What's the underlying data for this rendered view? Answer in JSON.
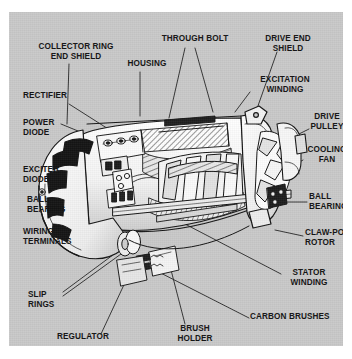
{
  "figure": {
    "kind": "technical-cutaway-illustration",
    "panel_background": "#c9c9c9",
    "page_background": "#ffffff",
    "line_color": "#161616",
    "labels": [
      {
        "id": "collector-ring-end-shield",
        "text": "COLLECTOR RING\nEND SHIELD",
        "x": 13,
        "y": 30,
        "w": 108,
        "align": "c"
      },
      {
        "id": "through-bolt",
        "text": "THROUGH BOLT",
        "x": 146,
        "y": 22,
        "w": 80,
        "align": "c"
      },
      {
        "id": "drive-end-shield",
        "text": "DRIVE END\nSHIELD",
        "x": 248,
        "y": 22,
        "w": 62,
        "align": "c"
      },
      {
        "id": "housing",
        "text": "HOUSING",
        "x": 112,
        "y": 47,
        "w": 52,
        "align": "c"
      },
      {
        "id": "rectifier",
        "text": "RECTIFIER",
        "x": 14,
        "y": 79,
        "w": 54,
        "align": "l"
      },
      {
        "id": "excitation-winding",
        "text": "EXCITATION\nWINDING",
        "x": 243,
        "y": 63,
        "w": 66,
        "align": "c"
      },
      {
        "id": "power-diode",
        "text": "POWER\nDIODE",
        "x": 14,
        "y": 106,
        "w": 46,
        "align": "l"
      },
      {
        "id": "drive-pulley",
        "text": "DRIVE\nPULLEY",
        "x": 297,
        "y": 100,
        "w": 42,
        "align": "c"
      },
      {
        "id": "cooling-fan",
        "text": "COOLING\nFAN",
        "x": 294,
        "y": 133,
        "w": 48,
        "align": "c"
      },
      {
        "id": "exciter-diode",
        "text": "EXCITER\nDIODE",
        "x": 14,
        "y": 153,
        "w": 52,
        "align": "l"
      },
      {
        "id": "ball-bearing-left",
        "text": "BALL\nBEARING",
        "x": 18,
        "y": 183,
        "w": 52,
        "align": "l"
      },
      {
        "id": "ball-bearing-right",
        "text": "BALL\nBEARING",
        "x": 300,
        "y": 180,
        "w": 48,
        "align": "l"
      },
      {
        "id": "wiring-terminals",
        "text": "WIRING\nTERMINALS",
        "x": 14,
        "y": 215,
        "w": 64,
        "align": "l"
      },
      {
        "id": "claw-pole-rotor",
        "text": "CLAW-POLE\nROTOR",
        "x": 296,
        "y": 216,
        "w": 56,
        "align": "l"
      },
      {
        "id": "stator-winding",
        "text": "STATOR\nWINDING",
        "x": 273,
        "y": 256,
        "w": 54,
        "align": "c"
      },
      {
        "id": "slip-rings",
        "text": "SLIP\nRINGS",
        "x": 19,
        "y": 278,
        "w": 34,
        "align": "l"
      },
      {
        "id": "carbon-brushes",
        "text": "CARBON BRUSHES",
        "x": 241,
        "y": 300,
        "w": 96,
        "align": "l"
      },
      {
        "id": "regulator",
        "text": "REGULATOR",
        "x": 48,
        "y": 320,
        "w": 62,
        "align": "l"
      },
      {
        "id": "brush-holder",
        "text": "BRUSH\nHOLDER",
        "x": 161,
        "y": 312,
        "w": 50,
        "align": "c"
      }
    ]
  }
}
